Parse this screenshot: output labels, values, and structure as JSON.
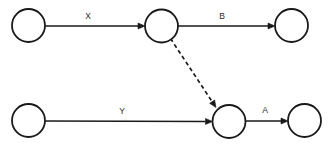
{
  "canvas": {
    "width": 331,
    "height": 149,
    "background_color": "#ffffff"
  },
  "style": {
    "stroke_color": "#1a1a1a",
    "node_fill": "#ffffff",
    "node_stroke_width": 1.8,
    "edge_stroke_width": 1.7,
    "dashed_pattern": "4 3",
    "label_color": "#2b2b2b",
    "label_font_size": 8.5,
    "node_radius": 16.5,
    "arrowhead_length": 7,
    "arrowhead_width": 6
  },
  "graph": {
    "type": "directed-node-arrow-diagram",
    "nodes": [
      {
        "id": "n1",
        "label": "",
        "cx": 28.5,
        "cy": 25.5,
        "r": 16.5,
        "row": "top",
        "position": "left"
      },
      {
        "id": "n2",
        "label": "",
        "cx": 161.5,
        "cy": 26.0,
        "r": 16.5,
        "row": "top",
        "position": "middle"
      },
      {
        "id": "n3",
        "label": "",
        "cx": 291.5,
        "cy": 25.5,
        "r": 16.5,
        "row": "top",
        "position": "right"
      },
      {
        "id": "n4",
        "label": "",
        "cx": 28.5,
        "cy": 120.5,
        "r": 16.5,
        "row": "bottom",
        "position": "left"
      },
      {
        "id": "n5",
        "label": "",
        "cx": 229.0,
        "cy": 121.5,
        "r": 16.5,
        "row": "bottom",
        "position": "middle"
      },
      {
        "id": "n6",
        "label": "",
        "cx": 304.5,
        "cy": 120.5,
        "r": 16.5,
        "row": "bottom",
        "position": "right"
      }
    ],
    "edges": [
      {
        "id": "e-x",
        "from": "n1",
        "to": "n2",
        "label": "X",
        "style": "solid",
        "x1": 45.0,
        "y1": 26.0,
        "x2": 145.0,
        "y2": 26.0,
        "label_x": 88.0,
        "label_y": 17.0
      },
      {
        "id": "e-b",
        "from": "n2",
        "to": "n3",
        "label": "B",
        "style": "solid",
        "x1": 178.0,
        "y1": 26.0,
        "x2": 275.0,
        "y2": 26.0,
        "label_x": 222.0,
        "label_y": 17.0
      },
      {
        "id": "e-dashed",
        "from": "n2",
        "to": "n5",
        "label": "",
        "style": "dashed",
        "x1": 170.5,
        "y1": 38.5,
        "x2": 216.0,
        "y2": 107.5,
        "label_x": 0,
        "label_y": 0
      },
      {
        "id": "e-y",
        "from": "n4",
        "to": "n5",
        "label": "Y",
        "style": "solid",
        "x1": 45.0,
        "y1": 121.0,
        "x2": 212.5,
        "y2": 121.5,
        "label_x": 122.0,
        "label_y": 112.0
      },
      {
        "id": "e-a",
        "from": "n5",
        "to": "n6",
        "label": "A",
        "style": "solid",
        "x1": 245.5,
        "y1": 121.0,
        "x2": 288.0,
        "y2": 121.0,
        "label_x": 265.0,
        "label_y": 111.0
      }
    ]
  }
}
